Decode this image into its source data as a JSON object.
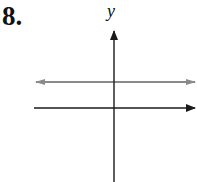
{
  "problem": {
    "number": "8."
  },
  "graph": {
    "y_axis_label": "y",
    "x_axis_label": "",
    "axis_color": "#1a1a1a",
    "line_color": "#8a8a8a",
    "description": "Horizontal line above the x-axis (y = positive constant)"
  }
}
